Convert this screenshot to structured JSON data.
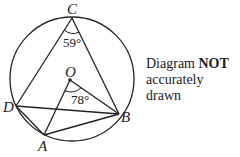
{
  "diagram": {
    "type": "circle-geometry",
    "circle": {
      "center": [
        72,
        79
      ],
      "radius": 62
    },
    "points": {
      "C": {
        "label": "C",
        "x": 72,
        "y": 18
      },
      "O": {
        "label": "O",
        "x": 70,
        "y": 80
      },
      "D": {
        "label": "D",
        "x": 16,
        "y": 106
      },
      "A": {
        "label": "A",
        "x": 44,
        "y": 135
      },
      "B": {
        "label": "B",
        "x": 119,
        "y": 114
      }
    },
    "segments": [
      [
        "C",
        "D"
      ],
      [
        "C",
        "B"
      ],
      [
        "D",
        "B"
      ],
      [
        "D",
        "A"
      ],
      [
        "A",
        "B"
      ],
      [
        "O",
        "A"
      ],
      [
        "O",
        "B"
      ]
    ],
    "angles": {
      "DCB": {
        "value": "59°",
        "vertex": "C"
      },
      "AOB": {
        "value": "78°",
        "vertex": "O"
      }
    }
  },
  "note": {
    "prefix": "Diagram ",
    "emphasis": "NOT",
    "line2": "accurately drawn"
  }
}
